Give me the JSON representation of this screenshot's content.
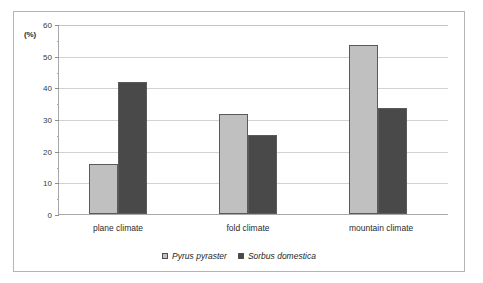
{
  "chart_data": {
    "type": "bar",
    "title": "",
    "subtitle": "",
    "xlabel": "",
    "ylabel": "(%)",
    "categories": [
      "plane climate",
      "fold climate",
      "mountain climate"
    ],
    "series": [
      {
        "name": "Pyrus pyraster",
        "color": "#c0c0c0",
        "values": [
          15.7,
          31.5,
          53.3
        ]
      },
      {
        "name": "Sorbus domestica",
        "color": "#494949",
        "values": [
          41.6,
          25.1,
          33.6
        ]
      }
    ],
    "ylim": [
      0,
      60
    ],
    "ytick_labels": [
      "0",
      "10",
      "20",
      "30",
      "40",
      "50",
      "60"
    ],
    "ytick_values": [
      0,
      10,
      20,
      30,
      40,
      50,
      60
    ],
    "yminor_values": [
      5,
      15,
      25,
      35,
      45,
      55
    ],
    "grid": "horizontal",
    "legend_position": "bottom-center",
    "annotations": []
  },
  "axis": {
    "unit_label": "(%)"
  },
  "legend": {
    "items": [
      {
        "label": "Pyrus pyraster",
        "color": "#c0c0c0"
      },
      {
        "label": "Sorbus domestica",
        "color": "#494949"
      }
    ]
  },
  "colors": {
    "series_light": "#c0c0c0",
    "series_dark": "#494949",
    "bar_outline": "#5a5a5a",
    "gridline": "#d2d2d2",
    "axis": "#a8a8a8",
    "frame": "#b5b5b5",
    "background": "#ffffff",
    "text": "#2b2b2b"
  }
}
